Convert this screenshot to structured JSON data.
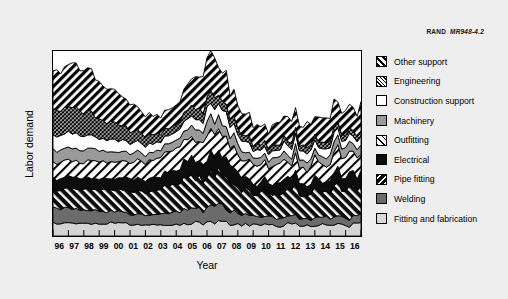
{
  "source_tag": {
    "org": "RAND",
    "code": "MR948-4.2"
  },
  "axes": {
    "y_title": "Labor demand",
    "x_title": "Year"
  },
  "legend": {
    "items": [
      {
        "label": "Other support",
        "pattern": "diagonal-stripe-bold-forward",
        "fill": "#000000"
      },
      {
        "label": "Engineering",
        "pattern": "crosshatch-fine",
        "fill": "#000000"
      },
      {
        "label": "Construction support",
        "pattern": "solid",
        "fill": "#ffffff"
      },
      {
        "label": "Machinery",
        "pattern": "solid",
        "fill": "#9a9a9a"
      },
      {
        "label": "Outfitting",
        "pattern": "diagonal-stripe-sparse-forward",
        "fill": "#ffffff"
      },
      {
        "label": "Electrical",
        "pattern": "solid",
        "fill": "#0d0d0d"
      },
      {
        "label": "Pipe fitting",
        "pattern": "diagonal-stripe-white-back",
        "fill": "#0d0d0d"
      },
      {
        "label": "Welding",
        "pattern": "solid",
        "fill": "#6b6b6b"
      },
      {
        "label": "Fitting and fabrication",
        "pattern": "solid",
        "fill": "#d9d9d9"
      }
    ]
  },
  "chart_data": {
    "type": "area",
    "title": "",
    "subtitle": "",
    "xlabel": "Year",
    "ylabel": "Labor demand",
    "stacked": true,
    "grid": false,
    "legend_position": "right",
    "axis_tick_labels_y": [],
    "x": [
      "96",
      "97",
      "98",
      "99",
      "00",
      "01",
      "02",
      "03",
      "04",
      "05",
      "06",
      "07",
      "08",
      "09",
      "10",
      "11",
      "12",
      "13",
      "14",
      "15",
      "16"
    ],
    "categories": [
      "96",
      "97",
      "98",
      "99",
      "00",
      "01",
      "02",
      "03",
      "04",
      "05",
      "06",
      "07",
      "08",
      "09",
      "10",
      "11",
      "12",
      "13",
      "14",
      "15",
      "16"
    ],
    "xlim": [
      1996,
      2016
    ],
    "ylim": [
      0,
      100
    ],
    "series": [
      {
        "name": "Fitting and fabrication",
        "values": [
          7,
          7,
          7,
          7,
          7,
          6.5,
          6,
          6,
          6,
          6.5,
          7,
          7,
          6.5,
          6,
          6,
          6,
          6,
          6,
          6,
          6,
          6
        ]
      },
      {
        "name": "Welding",
        "values": [
          8,
          8,
          7.5,
          7,
          6.5,
          6,
          5.5,
          6,
          7,
          8,
          8.5,
          8,
          6.5,
          4.5,
          4,
          4,
          4,
          4,
          4,
          4,
          4
        ]
      },
      {
        "name": "Pipe fitting",
        "values": [
          10,
          10.5,
          11,
          11.5,
          12.5,
          13,
          13,
          13.5,
          15,
          17,
          18,
          17,
          15,
          13.5,
          14,
          14.5,
          15,
          15,
          15.5,
          16,
          16
        ]
      },
      {
        "name": "Electrical",
        "values": [
          6,
          6,
          6,
          6,
          6,
          6.5,
          7,
          7,
          8,
          9,
          10,
          9.5,
          8,
          6,
          6,
          6,
          6,
          6,
          6,
          6.5,
          7
        ]
      },
      {
        "name": "Outfitting",
        "values": [
          9,
          9,
          9,
          9,
          9,
          9,
          9.5,
          10.5,
          11.5,
          12,
          12,
          11.5,
          10.5,
          9,
          9,
          9,
          9.5,
          9.5,
          9.5,
          10,
          10
        ]
      },
      {
        "name": "Machinery",
        "values": [
          7,
          7,
          6.5,
          6,
          5.5,
          5,
          4.5,
          4,
          4.5,
          5.5,
          6.5,
          6.5,
          5.5,
          4,
          4,
          4.5,
          4.5,
          4.5,
          4.5,
          4.5,
          4.5
        ]
      },
      {
        "name": "Construction support",
        "values": [
          8,
          8,
          7.5,
          7,
          6.5,
          6,
          5,
          4,
          4.5,
          6,
          7,
          7,
          6,
          4.5,
          4.5,
          4.5,
          4.5,
          4.5,
          4.5,
          4.5,
          4.5
        ]
      },
      {
        "name": "Engineering",
        "values": [
          14,
          14,
          13,
          11,
          9,
          7,
          5.5,
          4,
          4,
          5,
          6,
          5.5,
          4,
          3,
          3,
          3,
          3,
          3,
          3,
          3,
          3
        ]
      },
      {
        "name": "Other support",
        "values": [
          21,
          22,
          22,
          20,
          17,
          14.5,
          11.5,
          9,
          10,
          14,
          18,
          18,
          13,
          10,
          10.5,
          11,
          12,
          11.5,
          12,
          13,
          14
        ]
      }
    ]
  }
}
